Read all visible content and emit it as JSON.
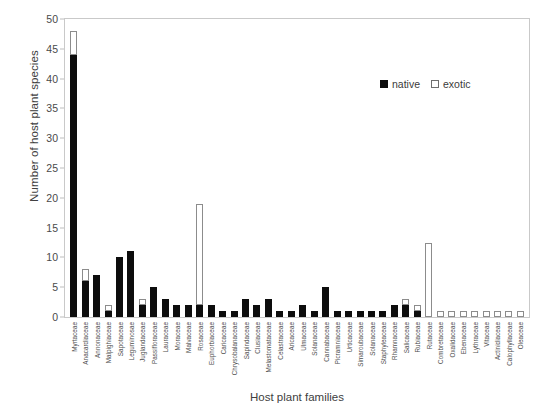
{
  "chart_data": {
    "type": "bar",
    "title": "",
    "xlabel": "Host plant families",
    "ylabel": "Number of host plant species",
    "ylim": [
      0,
      50
    ],
    "yticks": [
      0,
      5,
      10,
      15,
      20,
      25,
      30,
      35,
      40,
      45,
      50
    ],
    "grid": false,
    "stacked": true,
    "legend_position": "top-right",
    "categories": [
      "Myrtaceae",
      "Anacardiaceae",
      "Annonaceae",
      "Malpighiaceae",
      "Sapotaceae",
      "Leguminosae",
      "Juglandaceae",
      "Passifloraceae",
      "Lauraceae",
      "Moraceae",
      "Malvaceae",
      "Rosaceae",
      "Euphorbiaceae",
      "Caricaceae",
      "Chrysobalanaceae",
      "Sapindaceae",
      "Clusiaceae",
      "Melastomataceae",
      "Celastraceae",
      "Aricaceae",
      "Ulmaceae",
      "Solanaceae",
      "Cannabaceae",
      "Picramniaceae",
      "Urticaceae",
      "Simaroubaceae",
      "Solanaceae",
      "Staphyleaceae",
      "Rhamnaceae",
      "Salicaceae",
      "Rubiaceae",
      "Rutaceae",
      "Combretaceae",
      "Oxalidaceae",
      "Ebenaceae",
      "Lythraceae",
      "Vitaceae",
      "Actinidiaceae",
      "Calophyllaceae",
      "Oleaceae"
    ],
    "series": [
      {
        "name": "native",
        "color": "#0d0d0d",
        "values": [
          44,
          6,
          7,
          1,
          10,
          11,
          2,
          5,
          3,
          2,
          2,
          2,
          2,
          1,
          1,
          3,
          2,
          3,
          1,
          1,
          2,
          1,
          5,
          1,
          1,
          1,
          1,
          1,
          2,
          2,
          1,
          0,
          0,
          0,
          0,
          0,
          0,
          0,
          0,
          0
        ]
      },
      {
        "name": "exotic",
        "color": "#ffffff",
        "values": [
          4,
          2,
          0,
          1,
          0,
          0,
          1,
          0,
          0,
          0,
          0,
          17,
          0,
          0,
          0,
          0,
          0,
          0,
          0,
          0,
          0,
          0,
          0,
          0,
          0,
          0,
          0,
          0,
          0,
          1,
          1,
          12.5,
          1,
          1,
          1,
          1,
          1,
          1,
          1,
          1
        ]
      }
    ],
    "totals": [
      48,
      8,
      7,
      2,
      10,
      11,
      3,
      5,
      3,
      2,
      2,
      19,
      2,
      1,
      1,
      3,
      2,
      3,
      1,
      1,
      2,
      1,
      5,
      1,
      1,
      1,
      1,
      1,
      2,
      3,
      2,
      12.5,
      1,
      1,
      1,
      1,
      1,
      1,
      1,
      1
    ]
  },
  "legend": {
    "items": [
      {
        "label": "native",
        "swatch": "filled-square"
      },
      {
        "label": "exotic",
        "swatch": "open-square"
      }
    ]
  }
}
